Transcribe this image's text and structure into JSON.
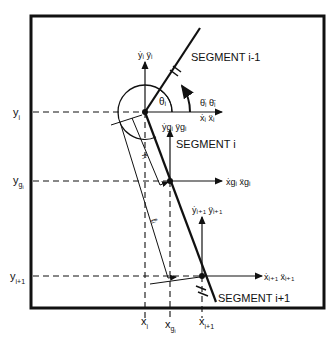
{
  "diagram": {
    "type": "free-body segment kinematics",
    "colors": {
      "ink": "#111111",
      "background": "#ffffff"
    },
    "segments": {
      "prev": "SEGMENT i-1",
      "current": "SEGMENT i",
      "next": "SEGMENT i+1"
    },
    "y_axis_labels": {
      "y_i": {
        "base": "y",
        "sub": "i"
      },
      "y_gi": {
        "base": "y",
        "sub": "g",
        "subsub": "i"
      },
      "y_i1": {
        "base": "y",
        "sub": "i+1"
      }
    },
    "x_axis_labels": {
      "x_i": {
        "base": "x",
        "sub": "i"
      },
      "x_gi": {
        "base": "x",
        "sub": "g",
        "subsub": "i"
      },
      "x_i1": {
        "base": "x",
        "sub": "i+1"
      }
    },
    "vectors": {
      "joint_i_vertical": "ẏᵢ ÿᵢ",
      "joint_i_horizontal": "ẋᵢ ẍᵢ",
      "angular": "θ̇ᵢ θ̈ᵢ",
      "com_vertical": "ẏgᵢ ÿgᵢ",
      "com_horizontal": "ẋgᵢ ẍgᵢ",
      "joint_i1_vertical": "ẏᵢ₊₁ ÿᵢ₊₁",
      "joint_i1_horizontal": "ẋᵢ₊₁ ẍᵢ₊₁"
    },
    "angle_label": "θᵢ",
    "distances": {
      "r": "rᵢ",
      "l": "ℓᵢ"
    }
  }
}
